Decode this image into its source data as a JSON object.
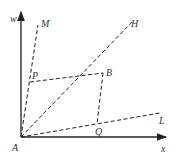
{
  "diagram": {
    "axes": {
      "vertical": "w",
      "horizontal": "x"
    },
    "points": {
      "A": "A",
      "M": "M",
      "P": "P",
      "B": "B",
      "H": "H",
      "Q": "Q",
      "L": "L"
    },
    "lines": [
      {
        "from": "A",
        "to": "M",
        "style": "dashed"
      },
      {
        "from": "A",
        "to": "H",
        "style": "dashed"
      },
      {
        "from": "A",
        "to": "L",
        "style": "dashed"
      },
      {
        "from": "P",
        "to": "B",
        "style": "dashed"
      },
      {
        "from": "B",
        "to": "Q",
        "style": "dashed"
      }
    ],
    "colors": {
      "stroke": "#222222"
    }
  }
}
